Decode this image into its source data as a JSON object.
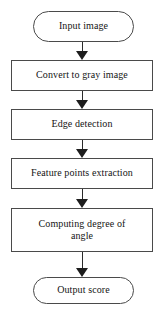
{
  "diagram": {
    "type": "flowchart",
    "orientation": "top-to-bottom",
    "line_color": "#4a4a4a",
    "text_color": "#141414",
    "background": "#ffffff",
    "nodes": [
      {
        "id": "input-image",
        "shape": "terminal",
        "label": "Input image"
      },
      {
        "id": "convert-to-gray-image",
        "shape": "process",
        "label": "Convert to gray image"
      },
      {
        "id": "edge-detection",
        "shape": "process",
        "label": "Edge detection"
      },
      {
        "id": "feature-points-extraction",
        "shape": "process",
        "label": "Feature points extraction"
      },
      {
        "id": "computing-degree-of-angle",
        "shape": "process",
        "label": "Computing degree of\nangle"
      },
      {
        "id": "output-score",
        "shape": "terminal",
        "label": "Output score"
      }
    ],
    "connectors": [
      {
        "id": "arrow-1",
        "from": "input-image",
        "to": "convert-to-gray-image",
        "style": "solid-arrow-down"
      },
      {
        "id": "arrow-2",
        "from": "convert-to-gray-image",
        "to": "edge-detection",
        "style": "solid-arrow-down"
      },
      {
        "id": "arrow-3",
        "from": "edge-detection",
        "to": "feature-points-extraction",
        "style": "solid-arrow-down"
      },
      {
        "id": "arrow-4",
        "from": "feature-points-extraction",
        "to": "computing-degree-of-angle",
        "style": "solid-arrow-down"
      },
      {
        "id": "arrow-5",
        "from": "computing-degree-of-angle",
        "to": "output-score",
        "style": "solid-arrow-down"
      }
    ]
  }
}
